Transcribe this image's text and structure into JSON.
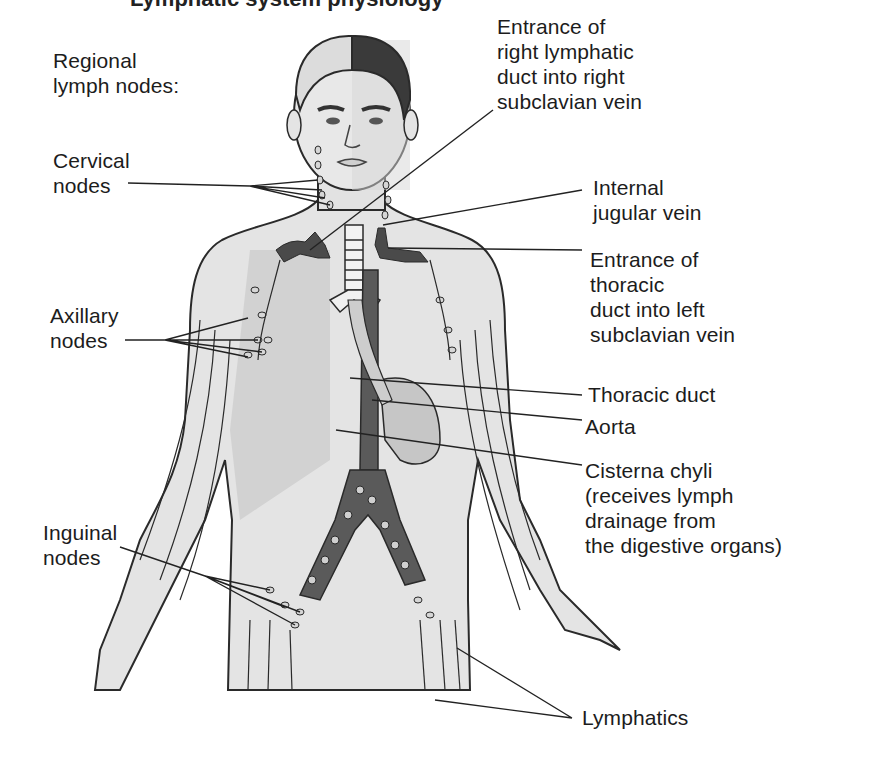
{
  "figure": {
    "title_fragment": "Lymphatic system physiology",
    "colors": {
      "background": "#ffffff",
      "skin": "#dcdcdc",
      "skin_light": "#e9e9e9",
      "outline": "#2a2a2a",
      "vessel_dark": "#5a5a5a",
      "vein": "#4a4a4a",
      "hair_dark": "#3a3a3a",
      "hair_light": "#d8d8d8",
      "label_text": "#1c1c1c"
    }
  },
  "labels_left": {
    "regional_heading": "Regional\nlymph nodes:",
    "cervical": "Cervical\nnodes",
    "axillary": "Axillary\nnodes",
    "inguinal": "Inguinal\nnodes"
  },
  "labels_right": {
    "right_lymphatic_duct": "Entrance of\nright lymphatic\nduct into right\nsubclavian vein",
    "internal_jugular": "Internal\njugular vein",
    "thoracic_duct_entrance": "Entrance of\nthoracic\nduct into left\nsubclavian vein",
    "thoracic_duct": "Thoracic duct",
    "aorta": "Aorta",
    "cisterna_chyli": "Cisterna chyli\n(receives lymph\ndrainage from\nthe digestive organs)",
    "lymphatics": "Lymphatics"
  }
}
